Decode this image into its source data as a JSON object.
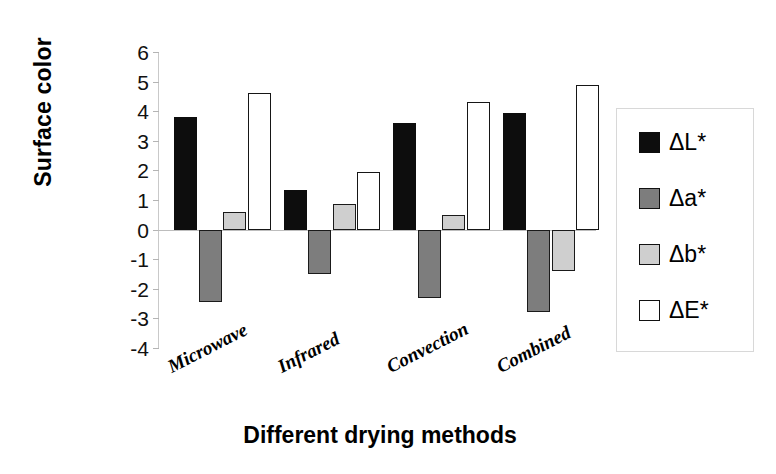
{
  "chart_data": {
    "type": "bar",
    "title": "",
    "xlabel": "Different drying methods",
    "ylabel": "Surface color",
    "categories": [
      "Microwave",
      "Infrared",
      "Convection",
      "Combined"
    ],
    "series": [
      {
        "name": "ΔL*",
        "values": [
          3.8,
          1.35,
          3.6,
          3.95
        ],
        "color": "#0d0d0d"
      },
      {
        "name": "Δa*",
        "values": [
          -2.45,
          -1.5,
          -2.3,
          -2.8
        ],
        "color": "#7d7d7d"
      },
      {
        "name": "Δb*",
        "values": [
          0.6,
          0.85,
          0.5,
          -1.4
        ],
        "color": "#cfcfcf"
      },
      {
        "name": "ΔE*",
        "values": [
          4.6,
          1.95,
          4.3,
          4.9
        ],
        "color": "#ffffff"
      }
    ],
    "ylim": [
      -4,
      6
    ],
    "yticks": [
      6,
      5,
      4,
      3,
      2,
      1,
      0,
      -1,
      -2,
      -3,
      -4
    ],
    "ytick_labels": [
      "6",
      "5",
      "4",
      "3",
      "2",
      "1",
      "0",
      "-1",
      "-2",
      "-3",
      "-4"
    ],
    "grid": false,
    "legend_position": "right",
    "zero_line": true
  },
  "axes": {
    "y_title": "Surface color",
    "x_title": "Different drying methods"
  },
  "legend": {
    "entries": [
      "ΔL*",
      "Δa*",
      "Δb*",
      "ΔE*"
    ]
  }
}
